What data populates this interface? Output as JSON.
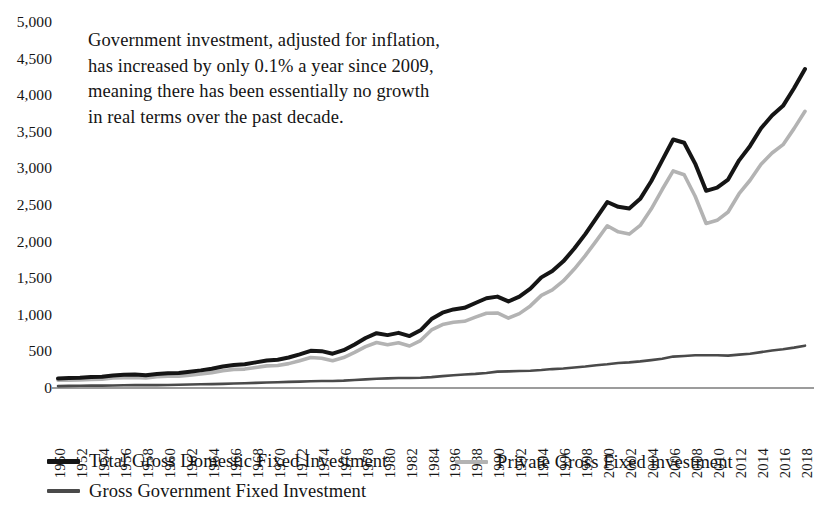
{
  "annotation": {
    "text": "Government investment, adjusted for inflation, has increased by only 0.1% a year since 2009, meaning there has been essentially no growth in real terms over the past decade."
  },
  "axis": {
    "y_ticks": [
      "5,000",
      "4,500",
      "4,000",
      "3,500",
      "3,000",
      "2,500",
      "2,000",
      "1,500",
      "1,000",
      "500",
      "0"
    ],
    "x_ticks": [
      "1950",
      "1952",
      "1954",
      "1956",
      "1958",
      "1960",
      "1962",
      "1964",
      "1966",
      "1968",
      "1970",
      "1972",
      "1974",
      "1976",
      "1978",
      "1980",
      "1982",
      "1984",
      "1986",
      "1988",
      "1990",
      "1992",
      "1994",
      "1996",
      "1998",
      "2000",
      "2002",
      "2004",
      "2006",
      "2008",
      "2010",
      "2012",
      "2014",
      "2016",
      "2018"
    ]
  },
  "legend": {
    "items": [
      {
        "label": "Total Gross Domestic Fixed Investment",
        "color": "#151515"
      },
      {
        "label": "Private Gross Fixed investment",
        "color": "#b3b3b3"
      },
      {
        "label": "Gross Government Fixed Investment",
        "color": "#4a4a4a"
      }
    ]
  },
  "chart_data": {
    "type": "line",
    "title": "",
    "xlabel": "",
    "ylabel": "",
    "xlim": [
      1950,
      2018
    ],
    "ylim": [
      0,
      5000
    ],
    "grid": false,
    "legend_position": "bottom",
    "x": [
      1950,
      1951,
      1952,
      1953,
      1954,
      1955,
      1956,
      1957,
      1958,
      1959,
      1960,
      1961,
      1962,
      1963,
      1964,
      1965,
      1966,
      1967,
      1968,
      1969,
      1970,
      1971,
      1972,
      1973,
      1974,
      1975,
      1976,
      1977,
      1978,
      1979,
      1980,
      1981,
      1982,
      1983,
      1984,
      1985,
      1986,
      1987,
      1988,
      1989,
      1990,
      1991,
      1992,
      1993,
      1994,
      1995,
      1996,
      1997,
      1998,
      1999,
      2000,
      2001,
      2002,
      2003,
      2004,
      2005,
      2006,
      2007,
      2008,
      2009,
      2010,
      2011,
      2012,
      2013,
      2014,
      2015,
      2016,
      2017,
      2018
    ],
    "series": [
      {
        "name": "Total Gross Domestic Fixed Investment",
        "color": "#151515",
        "values": [
          60,
          62,
          64,
          68,
          70,
          78,
          82,
          84,
          80,
          88,
          92,
          94,
          102,
          110,
          120,
          134,
          144,
          148,
          160,
          172,
          176,
          190,
          210,
          232,
          230,
          214,
          236,
          272,
          312,
          342,
          330,
          344,
          324,
          360,
          430,
          470,
          490,
          500,
          530,
          560,
          570,
          540,
          570,
          620,
          690,
          730,
          790,
          870,
          960,
          1060,
          1160,
          1130,
          1120,
          1180,
          1290,
          1420,
          1550,
          1530,
          1400,
          1230,
          1250,
          1300,
          1420,
          1510,
          1620,
          1700,
          1760,
          1870,
          1990
        ]
      },
      {
        "name": "Private Gross Fixed investment",
        "color": "#b3b3b3",
        "values": [
          48,
          49,
          50,
          53,
          55,
          62,
          65,
          66,
          62,
          70,
          73,
          74,
          80,
          87,
          96,
          108,
          116,
          118,
          128,
          138,
          140,
          152,
          170,
          190,
          186,
          170,
          190,
          222,
          258,
          284,
          270,
          282,
          262,
          296,
          362,
          396,
          410,
          416,
          442,
          466,
          468,
          436,
          464,
          512,
          578,
          612,
          668,
          742,
          826,
          918,
          1012,
          974,
          960,
          1014,
          1116,
          1238,
          1354,
          1330,
          1196,
          1026,
          1046,
          1098,
          1212,
          1296,
          1396,
          1466,
          1518,
          1618,
          1726
        ]
      },
      {
        "name": "Gross Government Fixed Investment",
        "color": "#4a4a4a",
        "values": [
          12,
          13,
          14,
          15,
          15,
          16,
          17,
          18,
          18,
          18,
          19,
          20,
          22,
          23,
          24,
          26,
          28,
          30,
          32,
          34,
          36,
          38,
          40,
          42,
          44,
          44,
          46,
          50,
          54,
          58,
          60,
          62,
          62,
          64,
          68,
          74,
          80,
          84,
          88,
          94,
          102,
          104,
          106,
          108,
          112,
          118,
          122,
          128,
          134,
          142,
          148,
          156,
          160,
          166,
          174,
          182,
          196,
          200,
          204,
          204,
          204,
          202,
          208,
          214,
          224,
          234,
          242,
          252,
          264
        ]
      }
    ],
    "scale_note": "values shown are index units; axis reads 0 to 5,000"
  },
  "series_pixel_paths": {
    "note": "normalized polyline coordinates used for rendering, x in 1950..2018 years, y in chart value units 0..5000",
    "total": [
      [
        1950,
        60
      ],
      [
        1952,
        64
      ],
      [
        1954,
        70
      ],
      [
        1956,
        82
      ],
      [
        1958,
        80
      ],
      [
        1960,
        92
      ],
      [
        1962,
        102
      ],
      [
        1964,
        120
      ],
      [
        1966,
        144
      ],
      [
        1968,
        160
      ],
      [
        1970,
        176
      ],
      [
        1972,
        210
      ],
      [
        1973,
        232
      ],
      [
        1974,
        230
      ],
      [
        1975,
        214
      ],
      [
        1976,
        236
      ],
      [
        1977,
        272
      ],
      [
        1978,
        312
      ],
      [
        1979,
        342
      ],
      [
        1980,
        330
      ],
      [
        1981,
        344
      ],
      [
        1982,
        324
      ],
      [
        1983,
        360
      ],
      [
        1984,
        430
      ],
      [
        1985,
        470
      ],
      [
        1986,
        490
      ],
      [
        1987,
        500
      ],
      [
        1988,
        530
      ],
      [
        1989,
        560
      ],
      [
        1990,
        570
      ],
      [
        1991,
        540
      ],
      [
        1992,
        570
      ],
      [
        1993,
        620
      ],
      [
        1994,
        690
      ],
      [
        1995,
        730
      ],
      [
        1996,
        790
      ],
      [
        1997,
        870
      ],
      [
        1998,
        960
      ],
      [
        1999,
        1060
      ],
      [
        2000,
        1160
      ],
      [
        2001,
        1130
      ],
      [
        2002,
        1120
      ],
      [
        2003,
        1180
      ],
      [
        2004,
        1290
      ],
      [
        2005,
        1420
      ],
      [
        2006,
        1550
      ],
      [
        2007,
        1530
      ],
      [
        2008,
        1400
      ],
      [
        2009,
        1230
      ],
      [
        2010,
        1250
      ],
      [
        2011,
        1300
      ],
      [
        2012,
        1420
      ],
      [
        2013,
        1510
      ],
      [
        2014,
        1620
      ],
      [
        2015,
        1700
      ],
      [
        2016,
        1760
      ],
      [
        2017,
        1870
      ],
      [
        2018,
        1990
      ]
    ],
    "private": [
      [
        1950,
        48
      ],
      [
        1960,
        73
      ],
      [
        1970,
        140
      ],
      [
        1980,
        270
      ],
      [
        1990,
        468
      ],
      [
        2000,
        1012
      ],
      [
        2006,
        1354
      ],
      [
        2009,
        1026
      ],
      [
        2018,
        1726
      ]
    ],
    "government": [
      [
        1950,
        12
      ],
      [
        1960,
        19
      ],
      [
        1970,
        36
      ],
      [
        1980,
        60
      ],
      [
        1990,
        102
      ],
      [
        2000,
        148
      ],
      [
        2009,
        204
      ],
      [
        2014,
        224
      ],
      [
        2018,
        264
      ]
    ]
  }
}
